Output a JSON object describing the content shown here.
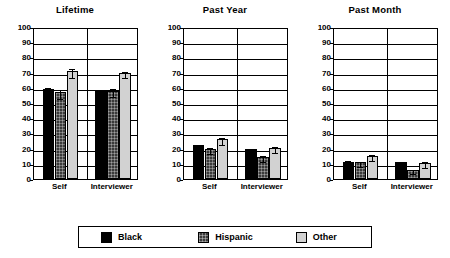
{
  "chart_data": {
    "type": "bar",
    "title": "",
    "xlabel": "",
    "ylabel": "",
    "ylim": [
      0,
      100
    ],
    "yticks": [
      0,
      10,
      20,
      30,
      40,
      50,
      60,
      70,
      80,
      90,
      100
    ],
    "grid": true,
    "legend_position": "bottom",
    "categories": [
      "Self",
      "Interviewer"
    ],
    "series_names": [
      "Black",
      "Hispanic",
      "Other"
    ],
    "series_colors": [
      "#000000",
      "#3a3a3a",
      "#d2d2d2"
    ],
    "panels": [
      {
        "title": "Lifetime",
        "series": [
          {
            "name": "Black",
            "values": [
              59.5,
              58.0
            ],
            "errors": [
              2.0,
              1.5
            ]
          },
          {
            "name": "Hispanic",
            "values": [
              57.0,
              58.0
            ],
            "errors": [
              3.0,
              2.5
            ]
          },
          {
            "name": "Other",
            "values": [
              71.0,
              69.5
            ],
            "errors": [
              3.0,
              2.0
            ]
          }
        ]
      },
      {
        "title": "Past Year",
        "series": [
          {
            "name": "Black",
            "values": [
              22.5,
              19.5
            ],
            "errors": [
              1.5,
              1.5
            ]
          },
          {
            "name": "Hispanic",
            "values": [
              20.0,
              14.5
            ],
            "errors": [
              2.0,
              2.0
            ]
          },
          {
            "name": "Other",
            "values": [
              26.0,
              20.5
            ],
            "errors": [
              2.0,
              2.0
            ]
          }
        ]
      },
      {
        "title": "Past Month",
        "series": [
          {
            "name": "Black",
            "values": [
              11.5,
              11.0
            ],
            "errors": [
              1.5,
              1.5
            ]
          },
          {
            "name": "Hispanic",
            "values": [
              11.0,
              6.0
            ],
            "errors": [
              1.5,
              1.5
            ]
          },
          {
            "name": "Other",
            "values": [
              15.0,
              10.5
            ],
            "errors": [
              2.0,
              2.0
            ]
          }
        ]
      }
    ]
  },
  "legend": {
    "items": [
      {
        "label": "Black",
        "swatch": "black"
      },
      {
        "label": "Hispanic",
        "swatch": "hispanic"
      },
      {
        "label": "Other",
        "swatch": "other"
      }
    ]
  }
}
